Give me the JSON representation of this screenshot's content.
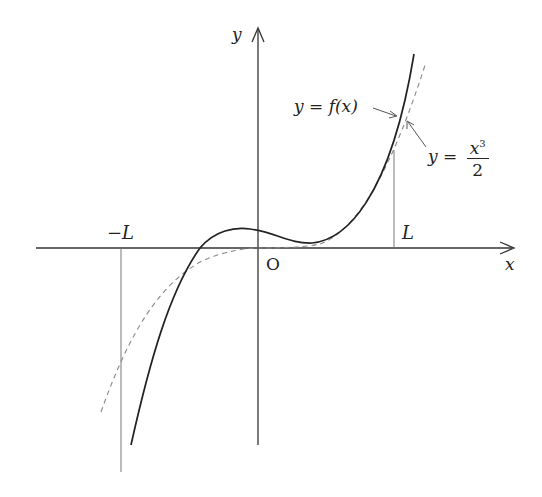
{
  "diagram": {
    "axes": {
      "x_label": "x",
      "y_label": "y",
      "origin_label": "O"
    },
    "markers": {
      "neg_L": "−L",
      "pos_L": "L"
    },
    "curves": [
      {
        "name": "f",
        "label": "y = f(x)",
        "style": "solid",
        "color": "#222222"
      },
      {
        "name": "cubic",
        "label_prefix": "y =",
        "numerator": "x",
        "exponent": "3",
        "denominator": "2",
        "style": "dashed",
        "color": "#777777"
      }
    ]
  }
}
